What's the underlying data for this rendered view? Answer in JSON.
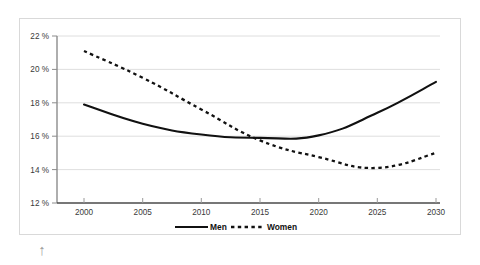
{
  "chart_data": {
    "type": "line",
    "title": "",
    "subtitle": "",
    "xlabel": "",
    "ylabel": "",
    "x": [
      2000,
      2005,
      2010,
      2015,
      2020,
      2025,
      2030
    ],
    "categories": [
      "2000",
      "2005",
      "2010",
      "2015",
      "2020",
      "2025",
      "2030"
    ],
    "series": [
      {
        "name": "Men",
        "style": "solid",
        "color": "#111111",
        "values": [
          17.9,
          16.75,
          16.1,
          15.9,
          16.05,
          17.4,
          19.25
        ]
      },
      {
        "name": "Women",
        "style": "dashed",
        "color": "#111111",
        "values": [
          21.1,
          19.5,
          17.6,
          15.75,
          14.75,
          14.1,
          15.0
        ]
      }
    ],
    "ylim": [
      12,
      22
    ],
    "ytick_values": [
      12,
      14,
      16,
      18,
      20,
      22
    ],
    "ytick_labels": [
      "12 %",
      "14 %",
      "16 %",
      "18 %",
      "20 %",
      "22 %"
    ],
    "xtick_labels": [
      "2000",
      "2005",
      "2010",
      "2015",
      "2020",
      "2025",
      "2030"
    ],
    "grid": true,
    "grid_axis": "y",
    "legend_position": "bottom-center",
    "legend_entries": [
      "Men",
      "Women"
    ],
    "units": "%"
  },
  "legend": {
    "men_label": "Men",
    "women_label": "Women"
  },
  "yaxis": {
    "t22": "22 %",
    "t20": "20 %",
    "t18": "18 %",
    "t16": "16 %",
    "t14": "14 %",
    "t12": "12 %"
  },
  "xaxis": {
    "t2000": "2000",
    "t2005": "2005",
    "t2010": "2010",
    "t2015": "2015",
    "t2020": "2020",
    "t2025": "2025",
    "t2030": "2030"
  },
  "cursor": {
    "glyph": "↑",
    "icon_name": "up-arrow-icon"
  }
}
